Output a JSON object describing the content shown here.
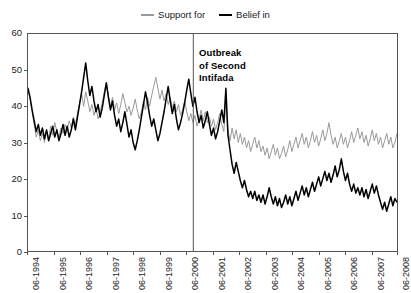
{
  "legend": {
    "position": "top-center",
    "entries": [
      {
        "label": "Support for",
        "color": "#9a9a9a",
        "icon": "line-swatch-gray"
      },
      {
        "label": "Belief in",
        "color": "#000000",
        "icon": "line-swatch-black"
      }
    ]
  },
  "annotation": {
    "text": "Outbreak\nof Second\nIntifada",
    "at_x_label": "10-2000"
  },
  "chart_data": {
    "type": "line",
    "title": "",
    "subtitle": "",
    "xlabel": "",
    "ylabel": "",
    "ylim": [
      0,
      60
    ],
    "yticks": [
      0,
      10,
      20,
      30,
      40,
      50,
      60
    ],
    "grid": false,
    "legend_position": "top-center",
    "x_tick_labels": [
      "06-1994",
      "06-1995",
      "06-1996",
      "06-1997",
      "06-1998",
      "06-1999",
      "06-2000",
      "06-2001",
      "06-2002",
      "06-2003",
      "06-2004",
      "06-2005",
      "06-2006",
      "06-2007",
      "06-2008"
    ],
    "x_start": "06-1994",
    "x_end": "06-2008",
    "x_point_interval": "monthly",
    "annotations": [
      {
        "type": "vline",
        "label": "Outbreak of Second Intifada",
        "x_fraction": 0.448,
        "color": "#555555"
      }
    ],
    "series": [
      {
        "name": "Support for",
        "color": "#9a9a9a",
        "values": [
          44.5,
          42.0,
          38.5,
          35.0,
          31.5,
          33.5,
          30.5,
          32.5,
          30.0,
          33.5,
          31.0,
          34.5,
          32.0,
          35.5,
          33.0,
          31.5,
          34.0,
          32.5,
          35.0,
          33.5,
          36.0,
          34.0,
          37.0,
          35.0,
          38.0,
          41.0,
          43.5,
          40.0,
          44.0,
          41.5,
          38.5,
          40.5,
          37.5,
          39.5,
          36.5,
          38.5,
          41.0,
          44.0,
          46.5,
          43.0,
          40.0,
          42.5,
          39.0,
          41.0,
          38.0,
          40.5,
          43.5,
          41.0,
          38.5,
          40.0,
          37.5,
          39.5,
          42.0,
          39.0,
          36.5,
          38.5,
          41.5,
          39.0,
          42.5,
          40.0,
          43.0,
          45.5,
          48.0,
          45.0,
          42.0,
          44.5,
          41.5,
          43.5,
          40.5,
          42.5,
          39.5,
          41.5,
          38.5,
          40.5,
          37.5,
          39.0,
          41.5,
          38.5,
          36.0,
          38.0,
          35.5,
          37.5,
          34.5,
          36.5,
          39.0,
          36.0,
          38.5,
          35.5,
          37.0,
          34.5,
          36.5,
          33.5,
          35.5,
          38.0,
          35.0,
          33.0,
          42.0,
          33.5,
          30.5,
          34.0,
          31.0,
          33.5,
          30.0,
          32.5,
          29.5,
          31.5,
          28.5,
          30.5,
          27.5,
          29.5,
          31.5,
          28.5,
          30.5,
          27.5,
          29.0,
          26.5,
          28.5,
          25.5,
          27.5,
          29.5,
          26.5,
          28.5,
          25.5,
          27.0,
          29.0,
          26.0,
          28.0,
          30.5,
          27.5,
          29.5,
          31.5,
          28.5,
          30.5,
          32.5,
          29.5,
          31.5,
          28.5,
          30.5,
          33.0,
          30.0,
          32.0,
          29.0,
          31.0,
          33.5,
          30.5,
          32.5,
          35.5,
          32.0,
          29.5,
          31.5,
          28.5,
          30.5,
          32.5,
          29.5,
          31.5,
          28.5,
          30.5,
          33.0,
          30.0,
          32.0,
          34.0,
          31.0,
          33.0,
          30.0,
          32.0,
          29.0,
          31.0,
          33.5,
          30.5,
          32.5,
          29.5,
          31.5,
          28.5,
          30.5,
          32.5,
          29.5,
          31.5,
          28.5,
          30.0,
          32.5
        ]
      },
      {
        "name": "Belief in",
        "color": "#000000",
        "values": [
          45.0,
          42.5,
          39.0,
          36.0,
          33.0,
          35.0,
          32.0,
          34.0,
          31.0,
          33.5,
          30.5,
          32.5,
          34.5,
          31.5,
          33.5,
          30.5,
          32.5,
          35.0,
          32.0,
          34.5,
          31.5,
          33.5,
          36.5,
          33.5,
          37.0,
          40.5,
          44.0,
          48.0,
          52.0,
          47.0,
          43.0,
          45.5,
          41.5,
          38.5,
          40.5,
          37.0,
          39.5,
          43.0,
          46.5,
          42.5,
          39.0,
          41.5,
          37.5,
          34.5,
          36.5,
          33.0,
          35.5,
          38.5,
          35.0,
          31.5,
          33.5,
          30.0,
          28.0,
          30.5,
          33.5,
          37.0,
          40.5,
          44.0,
          41.0,
          37.5,
          34.5,
          36.5,
          33.5,
          30.5,
          32.5,
          35.5,
          38.5,
          42.0,
          45.5,
          41.5,
          38.0,
          40.5,
          36.5,
          33.5,
          35.5,
          38.0,
          41.0,
          44.5,
          47.5,
          43.5,
          40.0,
          42.5,
          38.5,
          35.5,
          37.5,
          34.0,
          36.0,
          38.5,
          35.0,
          32.0,
          34.0,
          31.0,
          33.0,
          36.0,
          39.0,
          35.5,
          45.0,
          32.0,
          28.0,
          24.0,
          21.5,
          24.5,
          22.0,
          19.5,
          17.5,
          19.5,
          17.0,
          15.0,
          16.5,
          14.5,
          16.5,
          14.0,
          15.5,
          13.5,
          15.5,
          13.0,
          15.0,
          17.5,
          15.0,
          13.0,
          15.0,
          12.5,
          14.5,
          12.0,
          13.5,
          15.5,
          13.0,
          15.0,
          12.5,
          14.5,
          16.5,
          14.0,
          16.0,
          18.0,
          15.5,
          17.5,
          15.0,
          17.0,
          19.0,
          16.5,
          18.5,
          20.5,
          18.0,
          20.0,
          22.0,
          19.5,
          21.5,
          19.0,
          21.0,
          23.5,
          20.5,
          22.5,
          25.5,
          22.0,
          19.5,
          21.5,
          18.5,
          16.5,
          18.5,
          16.0,
          17.5,
          15.5,
          17.5,
          15.0,
          17.0,
          14.5,
          16.5,
          18.5,
          16.0,
          18.0,
          15.5,
          13.5,
          11.5,
          13.5,
          11.0,
          13.0,
          15.0,
          12.5,
          14.5,
          13.5
        ]
      }
    ]
  }
}
